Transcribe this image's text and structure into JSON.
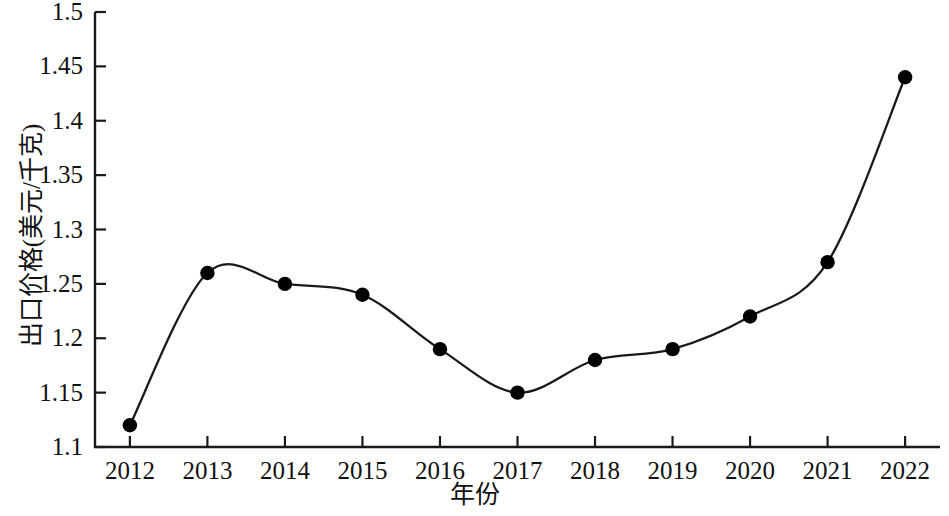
{
  "chart_data": {
    "type": "line",
    "title": "",
    "subtitle": "",
    "xlabel": "年份",
    "ylabel": "出口价格(美元/千克)",
    "categories": [
      "2012",
      "2013",
      "2014",
      "2015",
      "2016",
      "2017",
      "2018",
      "2019",
      "2020",
      "2021",
      "2022"
    ],
    "x": [
      2012,
      2013,
      2014,
      2015,
      2016,
      2017,
      2018,
      2019,
      2020,
      2021,
      2022
    ],
    "values": [
      1.12,
      1.26,
      1.25,
      1.24,
      1.19,
      1.15,
      1.18,
      1.19,
      1.22,
      1.27,
      1.44
    ],
    "series": [
      {
        "name": "出口价格",
        "values": [
          1.12,
          1.26,
          1.25,
          1.24,
          1.19,
          1.15,
          1.18,
          1.19,
          1.22,
          1.27,
          1.44
        ]
      }
    ],
    "ylim": [
      1.1,
      1.5
    ],
    "xlim": [
      2011.55,
      2022.45
    ],
    "ytick_labels": [
      "1.1",
      "1.15",
      "1.2",
      "1.25",
      "1.3",
      "1.35",
      "1.4",
      "1.45",
      "1.5"
    ],
    "ytick_values": [
      1.1,
      1.15,
      1.2,
      1.25,
      1.3,
      1.35,
      1.4,
      1.45,
      1.5
    ],
    "xtick_labels": [
      "2012",
      "2013",
      "2014",
      "2015",
      "2016",
      "2017",
      "2018",
      "2019",
      "2020",
      "2021",
      "2022"
    ],
    "grid": false,
    "legend": "none",
    "line_color": "#1a1a1a",
    "marker_color": "#000000",
    "marker_shape": "circle",
    "axis_color": "#1a1a1a",
    "background_color": "#ffffff",
    "smoothing": "spline",
    "spines": [
      "left",
      "bottom"
    ],
    "tick_direction": "in"
  }
}
